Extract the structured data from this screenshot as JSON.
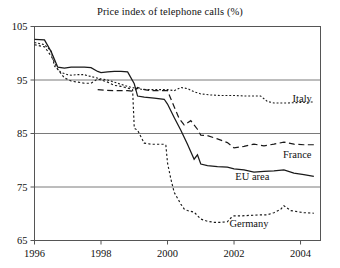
{
  "chart_data": {
    "type": "line",
    "title": "Price index of telephone calls (%)",
    "xlabel": "",
    "ylabel": "",
    "xlim": [
      1996.0,
      2004.6
    ],
    "ylim": [
      65,
      105
    ],
    "xticks": [
      1996,
      1998,
      2000,
      2002,
      2004
    ],
    "xtick_labels": [
      "1996",
      "1998",
      "2000",
      "2002",
      "2004"
    ],
    "yticks": [
      65,
      75,
      85,
      95,
      105
    ],
    "ytick_labels": [
      "65",
      "75",
      "85",
      "95",
      "105"
    ],
    "grid": "horizontal gridlines at 75, 85, 95",
    "legend_position": "inline labels at right end of each curve",
    "series": [
      {
        "name": "Italy",
        "label": "Italy",
        "line_style": "fine-dotted",
        "color": "#1a1a1a",
        "label_x": 2004.05,
        "label_y": 91.6,
        "x": [
          1996.0,
          1996.3,
          1996.5,
          1996.6,
          1996.8,
          1997.0,
          1997.1,
          1997.3,
          1997.5,
          1997.6,
          1997.8,
          1998.0,
          1998.2,
          1998.4,
          1998.6,
          1998.8,
          1999.0,
          1999.2,
          1999.4,
          1999.6,
          1999.8,
          2000.0,
          2000.2,
          2000.4,
          2000.6,
          2000.8,
          2001.0,
          2001.3,
          2001.6,
          2002.0,
          2002.4,
          2002.8,
          2003.0,
          2003.2,
          2003.6,
          2004.0,
          2004.4
        ],
        "y": [
          102.0,
          101.6,
          100.4,
          97.6,
          96.4,
          96.0,
          95.9,
          96.0,
          96.0,
          95.8,
          95.5,
          95.2,
          95.0,
          94.6,
          94.2,
          93.8,
          93.5,
          93.3,
          93.2,
          93.2,
          93.2,
          93.2,
          93.0,
          93.6,
          93.4,
          92.8,
          92.4,
          92.2,
          92.1,
          92.1,
          92.0,
          92.0,
          91.0,
          90.7,
          90.7,
          90.8,
          90.9
        ]
      },
      {
        "name": "France",
        "label": "France",
        "line_style": "dashed",
        "color": "#1a1a1a",
        "label_x": 2003.9,
        "label_y": 81.1,
        "x": [
          1997.9,
          1998.1,
          1998.4,
          1998.8,
          1999.0,
          1999.1,
          1999.3,
          1999.5,
          1999.7,
          1999.9,
          2000.0,
          2000.2,
          2000.35,
          2000.5,
          2000.7,
          2000.9,
          2001.0,
          2001.2,
          2001.5,
          2001.8,
          2002.0,
          2002.3,
          2002.6,
          2002.9,
          2003.2,
          2003.5,
          2003.8,
          2004.1,
          2004.4
        ],
        "y": [
          93.2,
          93.1,
          93.0,
          93.0,
          92.9,
          93.6,
          93.2,
          93.0,
          93.0,
          93.0,
          93.0,
          90.0,
          87.8,
          86.6,
          87.4,
          85.8,
          84.7,
          84.6,
          84.0,
          83.3,
          82.3,
          82.6,
          83.0,
          82.7,
          83.0,
          83.4,
          83.0,
          82.9,
          82.9
        ]
      },
      {
        "name": "EU area",
        "label": "EU area",
        "line_style": "solid",
        "color": "#1a1a1a",
        "label_x": 2002.55,
        "label_y": 76.9,
        "x": [
          1996.0,
          1996.3,
          1996.5,
          1996.7,
          1996.9,
          1997.1,
          1997.3,
          1997.5,
          1997.7,
          1997.9,
          1998.0,
          1998.2,
          1998.4,
          1998.6,
          1998.8,
          1999.0,
          1999.1,
          1999.3,
          1999.6,
          1999.9,
          2000.0,
          2000.2,
          2000.4,
          2000.6,
          2000.8,
          2000.9,
          2001.0,
          2001.2,
          2001.5,
          2001.8,
          2002.0,
          2002.3,
          2002.6,
          2002.9,
          2003.2,
          2003.5,
          2003.8,
          2004.1,
          2004.4
        ],
        "y": [
          102.6,
          102.5,
          100.3,
          97.4,
          97.2,
          97.4,
          97.4,
          97.4,
          97.3,
          96.6,
          96.4,
          96.5,
          96.6,
          96.6,
          96.5,
          94.3,
          92.0,
          91.8,
          91.6,
          91.4,
          90.5,
          88.0,
          85.6,
          83.0,
          80.2,
          81.0,
          79.3,
          79.0,
          78.8,
          78.7,
          78.4,
          78.2,
          77.8,
          77.9,
          78.0,
          78.2,
          77.6,
          77.3,
          77.0
        ]
      },
      {
        "name": "Germany",
        "label": "Germany",
        "line_style": "dotted",
        "color": "#1a1a1a",
        "label_x": 2002.45,
        "label_y": 68.2,
        "x": [
          1996.0,
          1996.3,
          1996.5,
          1996.7,
          1996.9,
          1997.1,
          1997.3,
          1997.5,
          1997.7,
          1997.9,
          1998.0,
          1998.2,
          1998.4,
          1998.6,
          1998.8,
          1998.95,
          1999.0,
          1999.1,
          1999.3,
          1999.5,
          1999.7,
          1999.9,
          1999.95,
          2000.0,
          2000.1,
          2000.2,
          2000.4,
          2000.5,
          2000.6,
          2000.8,
          2001.0,
          2001.2,
          2001.4,
          2001.6,
          2001.8,
          2001.9,
          2002.0,
          2002.2,
          2002.5,
          2002.8,
          2003.0,
          2003.2,
          2003.4,
          2003.5,
          2003.7,
          2003.9,
          2004.1,
          2004.4
        ],
        "y": [
          101.6,
          101.2,
          99.5,
          97.0,
          95.4,
          94.8,
          94.6,
          94.4,
          94.4,
          95.2,
          95.0,
          94.6,
          94.0,
          93.8,
          93.5,
          93.2,
          86.0,
          85.6,
          83.2,
          83.0,
          83.0,
          83.0,
          82.8,
          79.5,
          76.5,
          74.0,
          71.8,
          70.9,
          70.6,
          70.3,
          69.0,
          68.6,
          68.4,
          68.4,
          68.5,
          69.2,
          69.6,
          69.6,
          69.7,
          69.8,
          69.8,
          70.2,
          70.8,
          71.5,
          70.6,
          70.4,
          70.2,
          70.1
        ]
      }
    ]
  }
}
